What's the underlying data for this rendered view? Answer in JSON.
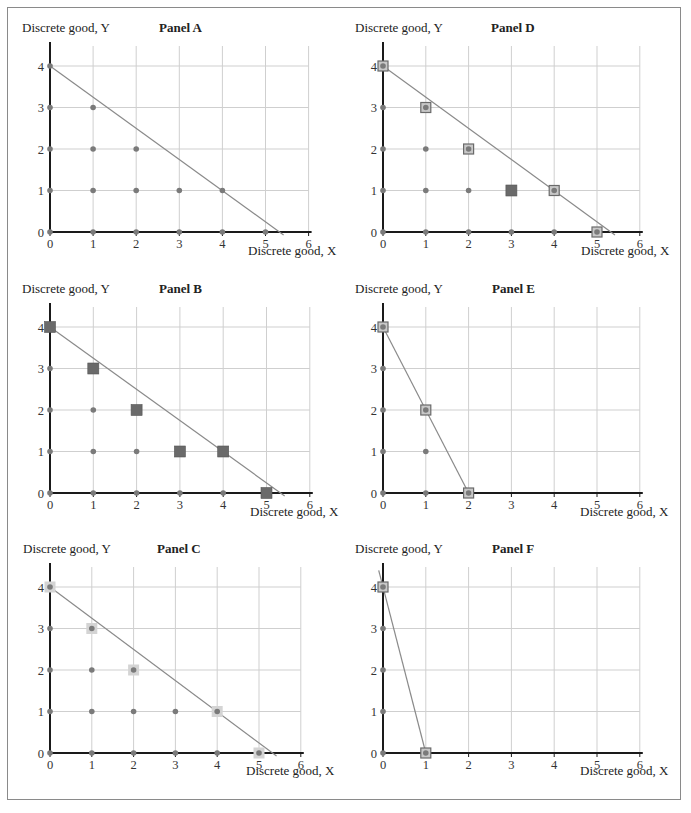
{
  "figure": {
    "y_axis_label": "Discrete good, Y",
    "x_axis_label": "Discrete good, X"
  },
  "colors": {
    "dot": "#7a7a7a",
    "grid": "#cfcfcf",
    "axis": "#1a1a1a",
    "budget_line": "#8a8a8a",
    "filled_square": "#6a6a6a",
    "outlined_square_fill": "#c8c8c8",
    "outlined_square_border": "#6a6a6a",
    "light_square": "#d4d4d4"
  },
  "panels": [
    {
      "id": "A",
      "title": "Panel A"
    },
    {
      "id": "B",
      "title": "Panel B"
    },
    {
      "id": "C",
      "title": "Panel C"
    },
    {
      "id": "D",
      "title": "Panel D"
    },
    {
      "id": "E",
      "title": "Panel E"
    },
    {
      "id": "F",
      "title": "Panel F"
    }
  ],
  "chart_data": [
    {
      "type": "scatter",
      "title": "Panel A",
      "xlabel": "Discrete good, X",
      "ylabel": "Discrete good, Y",
      "xlim": [
        0,
        6
      ],
      "ylim": [
        0,
        4
      ],
      "x_ticks": [
        0,
        1,
        2,
        3,
        4,
        5,
        6
      ],
      "y_ticks": [
        0,
        1,
        2,
        3,
        4
      ],
      "grid": true,
      "budget_line": {
        "from": [
          0,
          4
        ],
        "to": [
          5.4,
          0
        ]
      },
      "feasible_points": [
        [
          0,
          0
        ],
        [
          0,
          1
        ],
        [
          0,
          2
        ],
        [
          0,
          3
        ],
        [
          0,
          4
        ],
        [
          1,
          0
        ],
        [
          1,
          1
        ],
        [
          1,
          2
        ],
        [
          1,
          3
        ],
        [
          2,
          0
        ],
        [
          2,
          1
        ],
        [
          2,
          2
        ],
        [
          3,
          0
        ],
        [
          3,
          1
        ],
        [
          4,
          0
        ],
        [
          4,
          1
        ],
        [
          5,
          0
        ]
      ],
      "filled_squares": [],
      "outlined_squares": [],
      "light_squares": []
    },
    {
      "type": "scatter",
      "title": "Panel B",
      "xlabel": "Discrete good, X",
      "ylabel": "Discrete good, Y",
      "xlim": [
        0,
        6
      ],
      "ylim": [
        0,
        4
      ],
      "x_ticks": [
        0,
        1,
        2,
        3,
        4,
        5,
        6
      ],
      "y_ticks": [
        0,
        1,
        2,
        3,
        4
      ],
      "grid": true,
      "budget_line": {
        "from": [
          0,
          4
        ],
        "to": [
          5.4,
          0
        ]
      },
      "feasible_points": [
        [
          0,
          0
        ],
        [
          0,
          1
        ],
        [
          0,
          2
        ],
        [
          0,
          3
        ],
        [
          0,
          4
        ],
        [
          1,
          0
        ],
        [
          1,
          1
        ],
        [
          1,
          2
        ],
        [
          1,
          3
        ],
        [
          2,
          0
        ],
        [
          2,
          1
        ],
        [
          2,
          2
        ],
        [
          3,
          0
        ],
        [
          3,
          1
        ],
        [
          4,
          0
        ],
        [
          4,
          1
        ],
        [
          5,
          0
        ]
      ],
      "filled_squares": [
        [
          0,
          4
        ],
        [
          1,
          3
        ],
        [
          2,
          2
        ],
        [
          3,
          1
        ],
        [
          4,
          1
        ],
        [
          5,
          0
        ]
      ],
      "outlined_squares": [],
      "light_squares": []
    },
    {
      "type": "scatter",
      "title": "Panel C",
      "xlabel": "Discrete good, X",
      "ylabel": "Discrete good, Y",
      "xlim": [
        0,
        6
      ],
      "ylim": [
        0,
        4
      ],
      "x_ticks": [
        0,
        1,
        2,
        3,
        4,
        5,
        6
      ],
      "y_ticks": [
        0,
        1,
        2,
        3,
        4
      ],
      "grid": true,
      "budget_line": {
        "from": [
          0,
          4
        ],
        "to": [
          5.4,
          0
        ]
      },
      "feasible_points": [
        [
          0,
          0
        ],
        [
          0,
          1
        ],
        [
          0,
          2
        ],
        [
          0,
          3
        ],
        [
          0,
          4
        ],
        [
          1,
          0
        ],
        [
          1,
          1
        ],
        [
          1,
          2
        ],
        [
          1,
          3
        ],
        [
          2,
          0
        ],
        [
          2,
          1
        ],
        [
          2,
          2
        ],
        [
          3,
          0
        ],
        [
          3,
          1
        ],
        [
          4,
          0
        ],
        [
          4,
          1
        ],
        [
          5,
          0
        ]
      ],
      "filled_squares": [],
      "outlined_squares": [],
      "light_squares": [
        [
          0,
          4
        ],
        [
          1,
          3
        ],
        [
          2,
          2
        ],
        [
          4,
          1
        ],
        [
          5,
          0
        ]
      ]
    },
    {
      "type": "scatter",
      "title": "Panel D",
      "xlabel": "Discrete good, X",
      "ylabel": "Discrete good, Y",
      "xlim": [
        0,
        6
      ],
      "ylim": [
        0,
        4
      ],
      "x_ticks": [
        0,
        1,
        2,
        3,
        4,
        5,
        6
      ],
      "y_ticks": [
        0,
        1,
        2,
        3,
        4
      ],
      "grid": true,
      "budget_line": {
        "from": [
          0,
          4
        ],
        "to": [
          5.4,
          0
        ]
      },
      "feasible_points": [
        [
          0,
          0
        ],
        [
          0,
          1
        ],
        [
          0,
          2
        ],
        [
          0,
          3
        ],
        [
          0,
          4
        ],
        [
          1,
          0
        ],
        [
          1,
          1
        ],
        [
          1,
          2
        ],
        [
          1,
          3
        ],
        [
          2,
          0
        ],
        [
          2,
          1
        ],
        [
          2,
          2
        ],
        [
          3,
          0
        ],
        [
          3,
          1
        ],
        [
          4,
          0
        ],
        [
          4,
          1
        ],
        [
          5,
          0
        ]
      ],
      "filled_squares": [
        [
          3,
          1
        ]
      ],
      "outlined_squares": [
        [
          0,
          4
        ],
        [
          1,
          3
        ],
        [
          2,
          2
        ],
        [
          4,
          1
        ],
        [
          5,
          0
        ]
      ],
      "light_squares": []
    },
    {
      "type": "scatter",
      "title": "Panel E",
      "xlabel": "Discrete good, X",
      "ylabel": "Discrete good, Y",
      "xlim": [
        0,
        6
      ],
      "ylim": [
        0,
        4
      ],
      "x_ticks": [
        0,
        1,
        2,
        3,
        4,
        5,
        6
      ],
      "y_ticks": [
        0,
        1,
        2,
        3,
        4
      ],
      "grid": true,
      "budget_line": {
        "from": [
          0,
          4
        ],
        "to": [
          2,
          0
        ]
      },
      "feasible_points": [
        [
          0,
          0
        ],
        [
          0,
          1
        ],
        [
          0,
          2
        ],
        [
          0,
          3
        ],
        [
          0,
          4
        ],
        [
          1,
          0
        ],
        [
          1,
          1
        ],
        [
          1,
          2
        ],
        [
          2,
          0
        ]
      ],
      "filled_squares": [],
      "outlined_squares": [
        [
          0,
          4
        ],
        [
          1,
          2
        ],
        [
          2,
          0
        ]
      ],
      "light_squares": []
    },
    {
      "type": "scatter",
      "title": "Panel F",
      "xlabel": "Discrete good, X",
      "ylabel": "Discrete good, Y",
      "xlim": [
        0,
        6
      ],
      "ylim": [
        0,
        4
      ],
      "x_ticks": [
        0,
        1,
        2,
        3,
        4,
        5,
        6
      ],
      "y_ticks": [
        0,
        1,
        2,
        3,
        4
      ],
      "grid": true,
      "budget_line": {
        "from": [
          -0.1,
          4.4
        ],
        "to": [
          1,
          0
        ]
      },
      "feasible_points": [
        [
          0,
          0
        ],
        [
          0,
          1
        ],
        [
          0,
          2
        ],
        [
          0,
          3
        ],
        [
          0,
          4
        ],
        [
          1,
          0
        ]
      ],
      "filled_squares": [],
      "outlined_squares": [
        [
          0,
          4
        ],
        [
          1,
          0
        ]
      ],
      "light_squares": []
    }
  ]
}
